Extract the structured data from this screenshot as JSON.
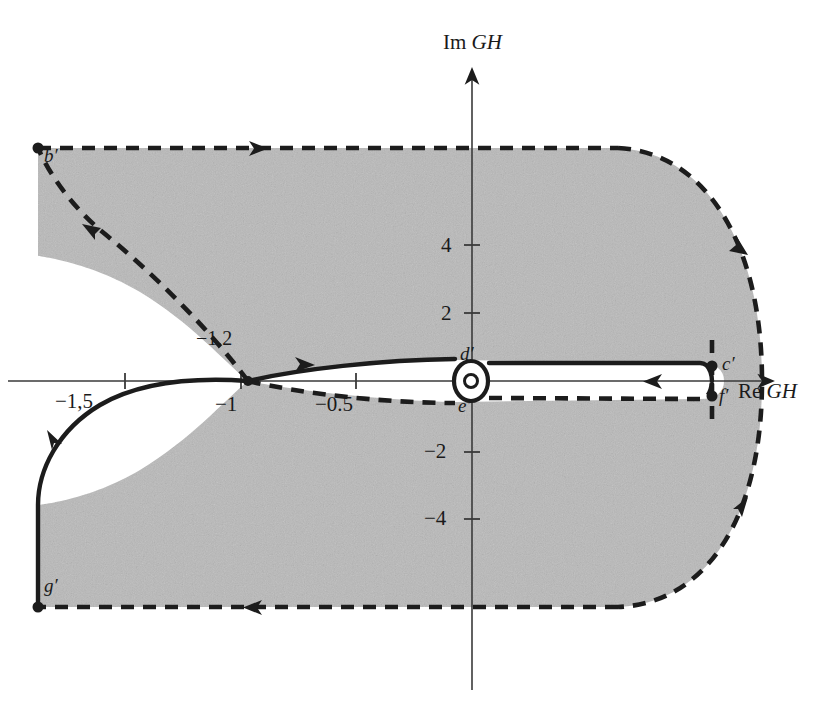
{
  "figure": {
    "kind": "nyquist-contour-plot",
    "background_color": "#ffffff",
    "shading_color": "#b9b9b9",
    "ink_color": "#1c1c1c"
  },
  "axes": {
    "x_axis_label": "Re GH",
    "x_axis_label_roman": "Re",
    "x_axis_label_italic": "GH",
    "y_axis_label": "Im GH",
    "y_axis_label_roman": "Im",
    "y_axis_label_italic": "GH",
    "origin_px": {
      "x": 472,
      "y": 381
    },
    "x_ticks": [
      {
        "label": "−1,5",
        "value": -1.5,
        "px": 125
      },
      {
        "label": "−1",
        "value": -1.0,
        "px": 241
      },
      {
        "label": "−0.5",
        "value": -0.5,
        "px": 356
      }
    ],
    "y_ticks": [
      {
        "label": "4",
        "value": 4,
        "px": 245
      },
      {
        "label": "2",
        "value": 2,
        "px": 313
      },
      {
        "label": "−2",
        "value": -2,
        "px": 452
      },
      {
        "label": "−4",
        "value": -4,
        "px": 519
      }
    ]
  },
  "annotations": {
    "crossing": {
      "label": "−1,2",
      "value": -1.2,
      "px": {
        "x": 248,
        "y": 340
      }
    }
  },
  "points": [
    {
      "name": "b-prime",
      "label": "b′",
      "px": {
        "x": 38,
        "y": 148
      }
    },
    {
      "name": "c-prime",
      "label": "c′",
      "px": {
        "x": 712,
        "y": 369
      }
    },
    {
      "name": "d-prime",
      "label": "d′",
      "px": {
        "x": 472,
        "y": 366
      }
    },
    {
      "name": "e-prime",
      "label": "e′",
      "px": {
        "x": 472,
        "y": 398
      }
    },
    {
      "name": "f-prime",
      "label": "f′",
      "px": {
        "x": 712,
        "y": 392
      }
    },
    {
      "name": "g-prime",
      "label": "g′",
      "px": {
        "x": 38,
        "y": 607
      }
    }
  ],
  "curves": {
    "solid_label": "mapped-contour-solid",
    "dashed_label": "mapped-contour-dashed",
    "direction_arrows": 9
  }
}
